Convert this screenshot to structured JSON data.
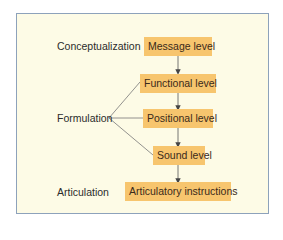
{
  "diagram": {
    "stages": [
      {
        "label": "Conceptualization"
      },
      {
        "label": "Formulation"
      },
      {
        "label": "Articulation"
      }
    ],
    "levels": [
      {
        "label": "Message level"
      },
      {
        "label": "Functional level"
      },
      {
        "label": "Positional level"
      },
      {
        "label": "Sound level"
      },
      {
        "label": "Articulatory instructions"
      }
    ],
    "colors": {
      "panel_background": "#fdfbe6",
      "panel_border": "#8da2bb",
      "box_fill": "#f7c56e",
      "connector": "#555555"
    }
  }
}
